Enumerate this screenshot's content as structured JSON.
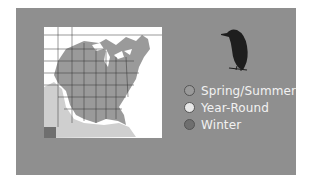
{
  "legend": {
    "items": [
      {
        "label": "Spring/Summer",
        "color": "#9a9a9a"
      },
      {
        "label": "Year-Round",
        "color": "#e8e8e8"
      },
      {
        "label": "Winter",
        "color": "#6f6f6f"
      }
    ]
  },
  "map": {
    "region": "Eastern United States",
    "range_color": "#9a9a9a",
    "background": "#ffffff"
  },
  "icons": {
    "bird": "bird-silhouette-icon"
  },
  "colors": {
    "card": "#8f8f8f",
    "label_text": "#f2f2f2"
  }
}
